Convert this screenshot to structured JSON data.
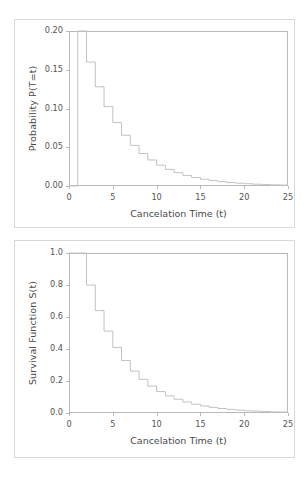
{
  "figure": {
    "background": "#ffffff",
    "panel_border_color": "#d8d8d8",
    "axis_color": "#b9b9b9",
    "line_color": "#c2c2c2"
  },
  "chart_data": [
    {
      "type": "line",
      "id": "pmf",
      "title": "",
      "xlabel": "Cancelation Time (t)",
      "ylabel": "Probability P(T=t)",
      "xlim": [
        0,
        25
      ],
      "ylim": [
        0.0,
        0.2
      ],
      "grid": false,
      "legend": null,
      "step": "post",
      "xticks": [
        0,
        5,
        10,
        15,
        20,
        25
      ],
      "xticklabels": [
        "0",
        "5",
        "10",
        "15",
        "20",
        "25"
      ],
      "yticks": [
        0.0,
        0.05,
        0.1,
        0.15,
        0.2
      ],
      "yticklabels": [
        "0.00",
        "0.05",
        "0.10",
        "0.15",
        "0.20"
      ],
      "x": [
        0,
        1,
        2,
        3,
        4,
        5,
        6,
        7,
        8,
        9,
        10,
        11,
        12,
        13,
        14,
        15,
        16,
        17,
        18,
        19,
        20,
        21,
        22,
        23,
        24,
        25
      ],
      "values": [
        0.0,
        0.2,
        0.16,
        0.128,
        0.1024,
        0.0819,
        0.0655,
        0.0524,
        0.0419,
        0.0336,
        0.0268,
        0.0215,
        0.0172,
        0.0137,
        0.011,
        0.0088,
        0.007,
        0.0056,
        0.0045,
        0.0036,
        0.0029,
        0.0023,
        0.0018,
        0.0015,
        0.0012,
        0.0009
      ]
    },
    {
      "type": "line",
      "id": "survival",
      "title": "",
      "xlabel": "Cancelation Time (t)",
      "ylabel": "Survival Function S(t)",
      "xlim": [
        0,
        25
      ],
      "ylim": [
        0.0,
        1.0
      ],
      "grid": false,
      "legend": null,
      "step": "post",
      "xticks": [
        0,
        5,
        10,
        15,
        20,
        25
      ],
      "xticklabels": [
        "0",
        "5",
        "10",
        "15",
        "20",
        "25"
      ],
      "yticks": [
        0.0,
        0.2,
        0.4,
        0.6,
        0.8,
        1.0
      ],
      "yticklabels": [
        "0.0",
        "0.2",
        "0.4",
        "0.6",
        "0.8",
        "1.0"
      ],
      "x": [
        0,
        1,
        2,
        3,
        4,
        5,
        6,
        7,
        8,
        9,
        10,
        11,
        12,
        13,
        14,
        15,
        16,
        17,
        18,
        19,
        20,
        21,
        22,
        23,
        24,
        25
      ],
      "values": [
        1.0,
        1.0,
        0.8,
        0.64,
        0.512,
        0.41,
        0.328,
        0.262,
        0.21,
        0.168,
        0.134,
        0.107,
        0.086,
        0.069,
        0.055,
        0.044,
        0.035,
        0.028,
        0.023,
        0.018,
        0.014,
        0.012,
        0.009,
        0.007,
        0.006,
        0.005
      ]
    }
  ]
}
